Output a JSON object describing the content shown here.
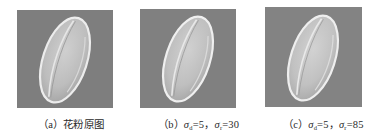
{
  "figure": {
    "panels": [
      {
        "id": "a",
        "label": "（a）",
        "caption_text": "花粉原图",
        "description": "original pollen grain micrograph"
      },
      {
        "id": "b",
        "label": "（b）",
        "sigma_d_symbol": "σ",
        "sigma_d_sub": "d",
        "sigma_d_value": "=5，",
        "sigma_r_symbol": "σ",
        "sigma_r_sub": "r",
        "sigma_r_value": "=30"
      },
      {
        "id": "c",
        "label": "（c）",
        "sigma_d_symbol": "σ",
        "sigma_d_sub": "d",
        "sigma_d_value": "=5，",
        "sigma_r_symbol": "σ",
        "sigma_r_sub": "r",
        "sigma_r_value": "=85"
      }
    ],
    "colors": {
      "background": "#7f7f7f",
      "grain_body": "#c6c6c6",
      "grain_highlight": "#f2f2f2",
      "caption_text": "#2a2a2a"
    }
  }
}
